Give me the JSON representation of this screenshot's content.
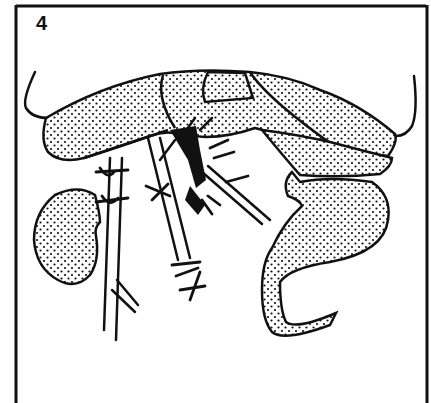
{
  "figure": {
    "panel_label": "4",
    "colors": {
      "ink": "#111111",
      "paper": "#ffffff"
    },
    "elements": [
      {
        "name": "frame",
        "type": "border"
      },
      {
        "name": "upper-organ-mass",
        "type": "stippled-shape"
      },
      {
        "name": "left-lobe",
        "type": "stippled-shape"
      },
      {
        "name": "central-segment",
        "type": "stippled-shape"
      },
      {
        "name": "right-lobe",
        "type": "stippled-shape"
      },
      {
        "name": "kidney",
        "type": "stippled-shape"
      },
      {
        "name": "bowel-loop",
        "type": "stippled-shape"
      },
      {
        "name": "left-vessel",
        "type": "vessel"
      },
      {
        "name": "middle-vessel",
        "type": "vessel"
      },
      {
        "name": "diagonal-vessel",
        "type": "vessel"
      },
      {
        "name": "ligature-ties",
        "type": "sutures"
      }
    ]
  }
}
